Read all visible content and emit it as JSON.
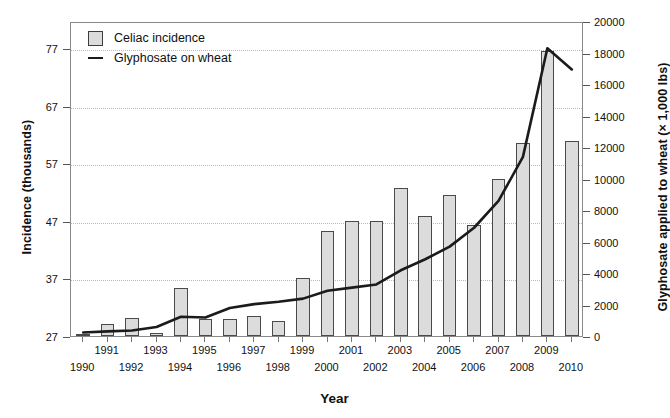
{
  "chart_data": {
    "type": "bar",
    "title": "",
    "xlabel": "Year",
    "ylabel": "Incidence (thousands)",
    "ylabel_right": "Glyphosate applied to wheat (× 1,000 lbs)",
    "grid": true,
    "legend_position": "top-left",
    "categories": [
      1990,
      1991,
      1992,
      1993,
      1994,
      1995,
      1996,
      1997,
      1998,
      1999,
      2000,
      2001,
      2002,
      2003,
      2004,
      2005,
      2006,
      2007,
      2008,
      2009,
      2010
    ],
    "xtick_labels_upper": [
      "",
      "1991",
      "",
      "1993",
      "",
      "1995",
      "",
      "1997",
      "",
      "1999",
      "",
      "2001",
      "",
      "2003",
      "",
      "2005",
      "",
      "2007",
      "",
      "2009",
      ""
    ],
    "xtick_labels_lower": [
      "1990",
      "",
      "1992",
      "",
      "1994",
      "",
      "1996",
      "",
      "1998",
      "",
      "2000",
      "",
      "2002",
      "",
      "2004",
      "",
      "2006",
      "",
      "2008",
      "",
      "2010"
    ],
    "yticks_left": [
      27,
      37,
      47,
      57,
      67,
      77
    ],
    "ylim_left": [
      27,
      81.7
    ],
    "yticks_right": [
      0,
      2000,
      4000,
      6000,
      8000,
      10000,
      12000,
      14000,
      16000,
      18000,
      20000
    ],
    "ylim_right": [
      0,
      20000
    ],
    "series": [
      {
        "name": "Celiac incidence",
        "type": "bar",
        "axis": "left",
        "color": "#dcdcdc",
        "edge_color": "#4a4a4a",
        "values": [
          27.4,
          29.1,
          30.2,
          27.6,
          35.4,
          30.0,
          29.9,
          30.5,
          29.6,
          37.0,
          45.3,
          47.0,
          47.0,
          52.7,
          47.9,
          51.5,
          46.3,
          54.2,
          60.6,
          76.5,
          60.8
        ]
      },
      {
        "name": "Glyphosate on wheat",
        "type": "line",
        "axis": "right",
        "color": "#1b1b1b",
        "values": [
          350,
          420,
          480,
          700,
          1350,
          1300,
          1900,
          2150,
          2300,
          2500,
          3000,
          3200,
          3400,
          4300,
          5000,
          5800,
          7000,
          8700,
          11500,
          18400,
          17050
        ]
      }
    ]
  },
  "legend": {
    "items": [
      {
        "label": "Celiac incidence",
        "marker": "swatch"
      },
      {
        "label": "Glyphosate on wheat",
        "marker": "line"
      }
    ]
  }
}
